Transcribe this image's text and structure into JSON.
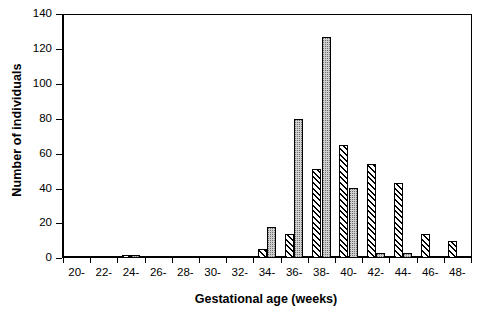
{
  "chart_data": {
    "type": "bar",
    "title": "",
    "subtitle": "",
    "xlabel": "Gestational age (weeks)",
    "ylabel": "Number of individuals",
    "categories": [
      "20-",
      "22-",
      "24-",
      "26-",
      "28-",
      "30-",
      "32-",
      "34-",
      "36-",
      "38-",
      "40-",
      "42-",
      "44-",
      "46-",
      "48-"
    ],
    "series": [
      {
        "name": "hatched",
        "fill": "diagonal-hatch",
        "values": [
          0,
          1,
          2,
          1,
          0,
          0,
          1,
          5,
          14,
          51,
          65,
          54,
          43,
          14,
          10
        ]
      },
      {
        "name": "stippled",
        "fill": "grey-stipple",
        "values": [
          0,
          1,
          2,
          1,
          0,
          1,
          1,
          18,
          80,
          127,
          40,
          3,
          3,
          0,
          0
        ]
      }
    ],
    "ylim": [
      0,
      140
    ],
    "ytick_values": [
      0,
      20,
      40,
      60,
      80,
      100,
      120,
      140
    ],
    "ytick_labels": [
      "0",
      "20",
      "40",
      "60",
      "80",
      "100",
      "120",
      "140"
    ],
    "grid": false,
    "legend": "none",
    "axis_color": "#000000",
    "background_color": "#ffffff",
    "hatch_color": "#000000",
    "stipple_color": "#cfcfcf"
  }
}
